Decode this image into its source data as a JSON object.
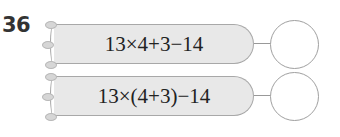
{
  "question": {
    "number": "36"
  },
  "problems": [
    {
      "expression": "13×4+3−14",
      "answer": ""
    },
    {
      "expression": "13×(4+3)−14",
      "answer": ""
    }
  ],
  "colors": {
    "pencil_fill": "#e8e8e8",
    "outline": "#a0a0a0",
    "text": "#222222"
  }
}
